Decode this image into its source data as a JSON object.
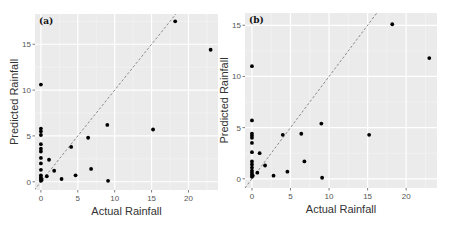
{
  "chart_data": [
    {
      "type": "scatter",
      "panel_label": "(a)",
      "title": "",
      "xlabel": "Actual Rainfall",
      "ylabel": "Predicted Rainfall",
      "xlim": [
        -0.8,
        24
      ],
      "ylim": [
        -0.9,
        18.3
      ],
      "xticks": [
        0,
        5,
        10,
        15,
        20
      ],
      "yticks": [
        0,
        5,
        10,
        15
      ],
      "grid": true,
      "reference_line": {
        "style": "dashed",
        "slope": 1,
        "intercept": 0,
        "color": "#8a8a8a"
      },
      "point_color": "#000000",
      "background": "#ebebeb",
      "points": [
        [
          0,
          10.6
        ],
        [
          0,
          5.8
        ],
        [
          0,
          5.5
        ],
        [
          0,
          5.1
        ],
        [
          0,
          4.1
        ],
        [
          0,
          3.6
        ],
        [
          0,
          3.3
        ],
        [
          0,
          2.6
        ],
        [
          0,
          2.0
        ],
        [
          0,
          1.3
        ],
        [
          0,
          0.7
        ],
        [
          0,
          0.5
        ],
        [
          0,
          0.3
        ],
        [
          0,
          0.1
        ],
        [
          0.1,
          0.2
        ],
        [
          0.8,
          0.6
        ],
        [
          1.1,
          2.4
        ],
        [
          1.8,
          1.2
        ],
        [
          2.8,
          0.3
        ],
        [
          4.1,
          3.8
        ],
        [
          4.7,
          0.7
        ],
        [
          6.4,
          4.8
        ],
        [
          6.8,
          1.4
        ],
        [
          9.0,
          6.2
        ],
        [
          9.1,
          0.1
        ],
        [
          15.2,
          5.7
        ],
        [
          18.2,
          17.5
        ],
        [
          23.0,
          14.4
        ]
      ]
    },
    {
      "type": "scatter",
      "panel_label": "(b)",
      "title": "",
      "xlabel": "Actual Rainfall",
      "ylabel": "Predicted Rainfall",
      "xlim": [
        -0.9,
        24
      ],
      "ylim": [
        -0.9,
        16.2
      ],
      "xticks": [
        0,
        5,
        10,
        15,
        20
      ],
      "yticks": [
        0,
        5,
        10,
        15
      ],
      "grid": true,
      "reference_line": {
        "style": "dashed",
        "slope": 1,
        "intercept": 0,
        "color": "#8a8a8a"
      },
      "point_color": "#000000",
      "background": "#ebebeb",
      "points": [
        [
          0,
          11.0
        ],
        [
          0,
          5.7
        ],
        [
          0,
          4.4
        ],
        [
          0,
          4.2
        ],
        [
          0,
          4.0
        ],
        [
          0,
          3.5
        ],
        [
          0,
          2.6
        ],
        [
          0,
          1.7
        ],
        [
          0,
          1.4
        ],
        [
          0,
          1.1
        ],
        [
          0,
          0.8
        ],
        [
          0,
          0.6
        ],
        [
          0,
          0.4
        ],
        [
          0,
          0.2
        ],
        [
          0.1,
          0.3
        ],
        [
          0.7,
          0.6
        ],
        [
          1.0,
          2.5
        ],
        [
          1.7,
          1.3
        ],
        [
          2.8,
          0.3
        ],
        [
          4.0,
          4.3
        ],
        [
          4.6,
          0.7
        ],
        [
          6.4,
          4.4
        ],
        [
          6.8,
          1.7
        ],
        [
          9.0,
          5.4
        ],
        [
          9.1,
          0.1
        ],
        [
          15.2,
          4.3
        ],
        [
          18.2,
          15.1
        ],
        [
          23.0,
          11.8
        ]
      ]
    }
  ],
  "layout": {
    "panels": [
      {
        "left": 35,
        "top": 14,
        "width": 183,
        "height": 176
      },
      {
        "left": 245,
        "top": 13,
        "width": 192,
        "height": 175
      }
    ]
  }
}
